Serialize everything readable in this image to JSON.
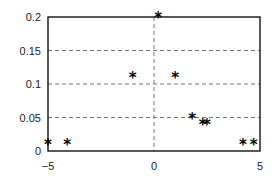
{
  "chart_data": {
    "type": "scatter",
    "title": "",
    "xlabel": "",
    "ylabel": "",
    "xlim": [
      -5,
      5
    ],
    "ylim": [
      0,
      0.2
    ],
    "grid": "dashed horizontal at y ticks, dashed vertical at x=0",
    "legend": "none",
    "marker": "*",
    "x_ticks": [
      {
        "value": -5,
        "label": "-5"
      },
      {
        "value": 0,
        "label": "0"
      },
      {
        "value": 5,
        "label": "5"
      }
    ],
    "y_ticks": [
      {
        "value": 0,
        "label": "0"
      },
      {
        "value": 0.05,
        "label": "0.05"
      },
      {
        "value": 0.1,
        "label": "0.1"
      },
      {
        "value": 0.15,
        "label": "0.15"
      },
      {
        "value": 0.2,
        "label": "0.2"
      }
    ],
    "points": [
      {
        "x": -5.0,
        "y": 0.01
      },
      {
        "x": -4.1,
        "y": 0.01
      },
      {
        "x": -1.0,
        "y": 0.11
      },
      {
        "x": 0.2,
        "y": 0.2
      },
      {
        "x": 1.0,
        "y": 0.11
      },
      {
        "x": 1.8,
        "y": 0.05
      },
      {
        "x": 2.3,
        "y": 0.04
      },
      {
        "x": 2.5,
        "y": 0.04
      },
      {
        "x": 4.2,
        "y": 0.01
      },
      {
        "x": 4.7,
        "y": 0.01
      }
    ]
  }
}
